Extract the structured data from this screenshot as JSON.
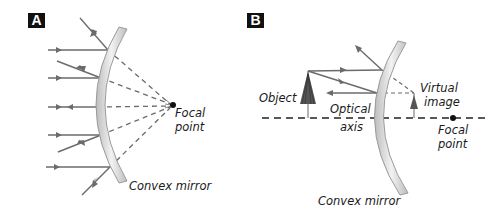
{
  "panels": [
    {
      "id": "A",
      "label": "A",
      "title_labels": {
        "focal_point_line1": "Focal",
        "focal_point_line2": "point",
        "mirror": "Convex mirror"
      }
    },
    {
      "id": "B",
      "label": "B",
      "title_labels": {
        "object": "Object",
        "optical_axis_line1": "Optical",
        "optical_axis_line2": "axis",
        "virtual_image_line1": "Virtual",
        "virtual_image_line2": "image",
        "focal_point_line1": "Focal",
        "focal_point_line2": "point",
        "mirror": "Convex mirror"
      }
    }
  ],
  "colors": {
    "ray": "#6b6b6b",
    "mirror_fill": "#d9d9d9",
    "mirror_edge": "#9a9a9a",
    "label_box": "#111111",
    "text": "#1a1a1a"
  }
}
